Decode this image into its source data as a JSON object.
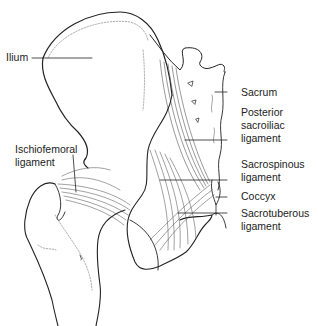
{
  "diagram": {
    "labels": [
      {
        "id": "ilium",
        "lines": [
          "Ilium"
        ]
      },
      {
        "id": "ischiofemoral",
        "lines": [
          "Ischiofemoral",
          "ligament"
        ]
      },
      {
        "id": "sacrum",
        "lines": [
          "Sacrum"
        ]
      },
      {
        "id": "posterior_sacroiliac",
        "lines": [
          "Posterior",
          "sacroiliac",
          "ligament"
        ]
      },
      {
        "id": "sacrospinous",
        "lines": [
          "Sacrospinous",
          "ligament"
        ]
      },
      {
        "id": "coccyx",
        "lines": [
          "Coccyx"
        ]
      },
      {
        "id": "sacrotuberous",
        "lines": [
          "Sacrotuberous",
          "ligament"
        ]
      }
    ],
    "colors": {
      "line": "#222222",
      "fiber": "#555555",
      "text": "#222222",
      "background": "#ffffff"
    }
  }
}
